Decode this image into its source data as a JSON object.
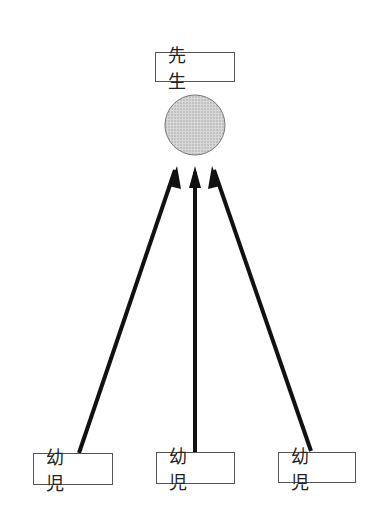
{
  "diagram": {
    "teacher": {
      "label": "先 生"
    },
    "children": [
      {
        "label": "幼 児"
      },
      {
        "label": "幼 児"
      },
      {
        "label": "幼 児"
      }
    ],
    "colors": {
      "circle_fill": "#cfcfcf",
      "circle_stroke": "#777777",
      "arrow": "#111111",
      "box_border": "#555555"
    }
  }
}
